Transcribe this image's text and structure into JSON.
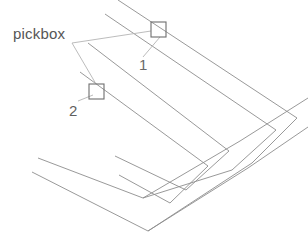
{
  "diagram": {
    "background_color": "#ffffff",
    "geometry_color": "#8d8d8d",
    "leader_color": "#b4b4b4",
    "pickbox_stroke_color": "#6e6e6e",
    "labels": {
      "pickbox": "pickbox",
      "marker_one": "1",
      "marker_two": "2"
    },
    "pickboxes": [
      {
        "id": "1",
        "x": 151,
        "y": 22,
        "width": 15,
        "height": 15
      },
      {
        "id": "2",
        "x": 89,
        "y": 84,
        "width": 15,
        "height": 15
      }
    ],
    "polylines": [
      {
        "name": "outer-rail-upper",
        "points": "118,0 297,118 252,163 148,231"
      },
      {
        "name": "outer-rail-lower",
        "points": "105,14 276,130 232,170 143,198"
      },
      {
        "name": "inner-rail-upper",
        "points": "88,43 229,151 186,190 115,156"
      },
      {
        "name": "inner-rail-lower",
        "points": "80,72 208,166 170,203 119,175"
      },
      {
        "name": "lower-band-upper",
        "points": "38,158 143,198 240,141 308,98"
      },
      {
        "name": "lower-band-lower",
        "points": "32,172 148,231 248,168 308,127"
      }
    ],
    "leaders": [
      {
        "name": "leader-to-pickbox-1",
        "points": "72,43 151,31"
      },
      {
        "name": "leader-to-pickbox-2",
        "points": "72,43 96,84"
      },
      {
        "name": "leader-marker-one",
        "points": "143,57 160,37"
      },
      {
        "name": "leader-marker-two",
        "points": "78,101 93,95"
      }
    ]
  }
}
